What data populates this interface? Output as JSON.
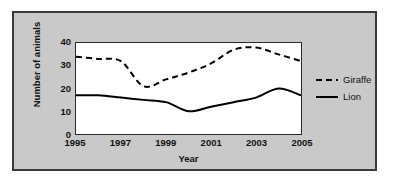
{
  "chart_data": {
    "type": "line",
    "title": "",
    "xlabel": "Year",
    "ylabel": "Number of animals",
    "xlim": [
      1995,
      2005
    ],
    "ylim": [
      0,
      40
    ],
    "xticks": [
      1995,
      1997,
      1999,
      2001,
      2003,
      2005
    ],
    "xtick_labels": [
      "1995",
      "1997",
      "1999",
      "2001",
      "2003",
      "2005"
    ],
    "yticks": [
      0,
      10,
      20,
      30,
      40
    ],
    "ytick_labels": [
      "0",
      "10",
      "20",
      "30",
      "40"
    ],
    "grid": false,
    "legend_position": "right",
    "x": [
      1995,
      1996,
      1997,
      1998,
      1999,
      2000,
      2001,
      2002,
      2003,
      2004,
      2005
    ],
    "series": [
      {
        "name": "Giraffe",
        "style": "dashed",
        "color": "#000000",
        "values": [
          34,
          33,
          32,
          21,
          24,
          27,
          31,
          37,
          38,
          35,
          32
        ]
      },
      {
        "name": "Lion",
        "style": "solid",
        "color": "#000000",
        "values": [
          17,
          17,
          16,
          15,
          14,
          10,
          12,
          14,
          16,
          20,
          17
        ]
      }
    ]
  },
  "legend": {
    "items": [
      {
        "label": "Giraffe",
        "style": "dashed"
      },
      {
        "label": "Lion",
        "style": "solid"
      }
    ]
  },
  "colors": {
    "panel_background": "#c9c9c9",
    "panel_border": "#3a3a3a",
    "plot_background": "#ffffff",
    "plot_border": "#2b2b2b",
    "line": "#000000",
    "text": "#111111"
  }
}
